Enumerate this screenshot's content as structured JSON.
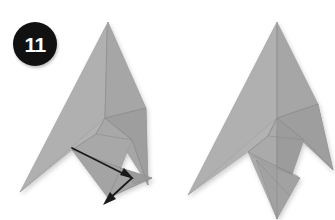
{
  "page": {
    "background_color": "#ffffff",
    "width": 335,
    "height": 220
  },
  "step": {
    "number": "11",
    "badge_shape": "circle",
    "badge_background": "#111111",
    "badge_text_color": "#ffffff"
  },
  "palette": {
    "paper_light": "#b4b4b4",
    "paper_mid": "#a3a3a3",
    "paper_dark": "#979797",
    "paper_darker": "#8d8d8d",
    "crease_line": "#8a8a8a",
    "edge_line": "#9e9e9e",
    "arrow_color": "#1a1a1a",
    "shadow": "rgba(0,0,0,0.14)"
  },
  "figures": [
    {
      "id": "figure-before",
      "label": "Model before fold",
      "side": "left",
      "apex": [
        108,
        22
      ],
      "center_junction": [
        105,
        118
      ],
      "left_wing_tip": [
        20,
        192
      ],
      "right_wing_tip": [
        148,
        185
      ],
      "has_arrow": true
    },
    {
      "id": "figure-after",
      "label": "Model after fold",
      "side": "right",
      "apex": [
        277,
        22
      ],
      "center_junction": [
        277,
        118
      ],
      "left_wing_tip": [
        188,
        195
      ],
      "right_wing_tip": [
        333,
        170
      ],
      "bottom_point": [
        277,
        219
      ],
      "has_arrow": false
    }
  ],
  "annotations": {
    "fold_arrow": {
      "name": "double-headed fold arrow",
      "type": "double-headed",
      "color": "#1a1a1a",
      "start": [
        72,
        148
      ],
      "end": [
        107,
        200
      ],
      "head_start": [
        131,
        178
      ],
      "head_end": [
        103,
        203
      ]
    }
  }
}
